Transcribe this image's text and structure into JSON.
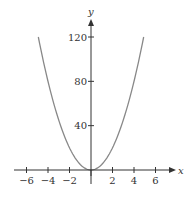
{
  "chart_data": {
    "type": "line",
    "title": "",
    "xlabel": "x",
    "ylabel": "y",
    "xlim": [
      -7,
      7.5
    ],
    "ylim": [
      0,
      135
    ],
    "x_ticks": [
      -6,
      -4,
      -2,
      2,
      4,
      6
    ],
    "x_tick_labels": [
      "−6",
      "−4",
      "−2",
      "2",
      "4",
      "6"
    ],
    "y_ticks": [
      40,
      80,
      120
    ],
    "y_tick_labels": [
      "40",
      "80",
      "120"
    ],
    "grid": false,
    "legend": null,
    "series": [
      {
        "name": "y = 5x²",
        "color": "#888888",
        "x": [
          -4.9,
          -4,
          -3,
          -2,
          -1,
          0,
          1,
          2,
          3,
          4,
          4.9
        ],
        "y": [
          120,
          80,
          45,
          20,
          5,
          0,
          5,
          20,
          45,
          80,
          120
        ]
      }
    ]
  },
  "colors": {
    "axis": "#333333",
    "curve": "#888888",
    "background": "#ffffff"
  }
}
